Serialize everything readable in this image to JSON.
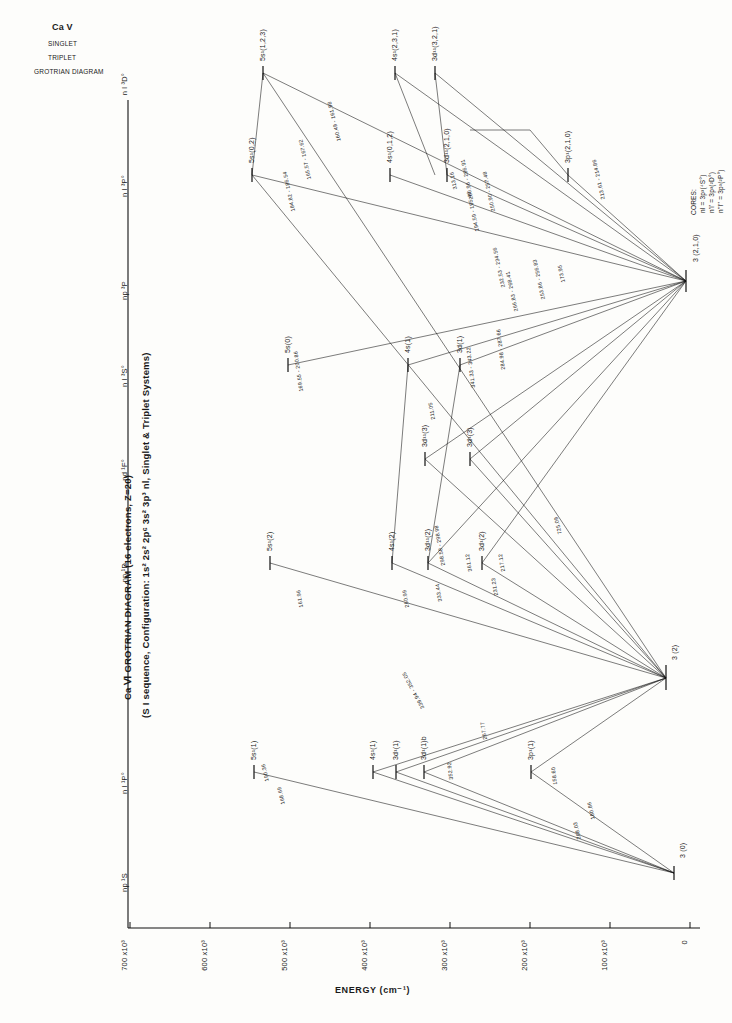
{
  "figure": {
    "corner_title": [
      "Ca V",
      "SINGLET",
      "TRIPLET",
      "GROTRIAN DIAGRAM"
    ],
    "main_title_line1": "Ca Ⅵ GROTRIAN DIAGRAM  (16 electrons, Z=20)",
    "main_title_line2": "(S I sequence, Configuration: 1s² 2s² 2p⁶ 3s² 3p³ nl, Singlet & Triplet  Systems)",
    "y_axis_label": "ENERGY  (cm⁻¹)",
    "cores_title": "CORES:",
    "cores": [
      "nl = 3p³(⁴S°)",
      "n'l' = 3p³(²D°)",
      "n''l'' = 3p³(²P°)"
    ]
  },
  "y_ticks": [
    {
      "label": "0",
      "value": 0
    },
    {
      "label": "100 x10³",
      "value": 100
    },
    {
      "label": "200 x10³",
      "value": 200
    },
    {
      "label": "300 x10³",
      "value": 300
    },
    {
      "label": "400 x10³",
      "value": 400
    },
    {
      "label": "500 x10³",
      "value": 500
    },
    {
      "label": "600 x10³",
      "value": 600
    },
    {
      "label": "700 x10³",
      "value": 700
    }
  ],
  "column_headers": [
    {
      "label": "np ¹S",
      "index": 0
    },
    {
      "label": "n l ¹P°",
      "index": 1
    },
    {
      "label": "np ¹D",
      "index": 2
    },
    {
      "label": "nd ¹F°",
      "index": 3
    },
    {
      "label": "n l ³S°",
      "index": 4
    },
    {
      "label": "np ³P",
      "index": 5
    },
    {
      "label": "n l ³P°",
      "index": 6
    },
    {
      "label": "n l ³D°",
      "index": 7
    }
  ],
  "levels": [
    {
      "label": "3 (0)",
      "col": 0,
      "energy": 4,
      "name": "level-3-0"
    },
    {
      "label": "5s¹(1)",
      "col": 1,
      "energy": 506,
      "name": "level-5s1-1"
    },
    {
      "label": "4s¹(1)",
      "col": 1,
      "energy": 358,
      "name": "level-4s1-1"
    },
    {
      "label": "3d¹(1)",
      "col": 1,
      "energy": 330,
      "name": "level-3d1-1"
    },
    {
      "label": "3d¹(1)b",
      "col": 1,
      "energy": 300,
      "name": "level-3d1-1b"
    },
    {
      "label": "3p¹(1)",
      "col": 1,
      "energy": 216,
      "name": "level-3p1-1"
    },
    {
      "label": "3 (2)",
      "col": 1,
      "energy": 26,
      "name": "level-3-2"
    },
    {
      "label": "5s¹(2)",
      "col": 2,
      "energy": 508,
      "name": "level-5s1-2"
    },
    {
      "label": "4s¹(2)",
      "col": 2,
      "energy": 360,
      "name": "level-4s1-2"
    },
    {
      "label": "3d¹¹(2)",
      "col": 2,
      "energy": 322,
      "name": "level-3d11-2"
    },
    {
      "label": "3d¹(2)",
      "col": 2,
      "energy": 290,
      "name": "level-3d1-2"
    },
    {
      "label": "3d¹¹(3)",
      "col": 3,
      "energy": 325,
      "name": "level-3d11-3"
    },
    {
      "label": "3d¹(3)",
      "col": 3,
      "energy": 300,
      "name": "level-3d1-3"
    },
    {
      "label": "5s(0)",
      "col": 4,
      "energy": 508,
      "name": "level-5s-0"
    },
    {
      "label": "4s(1)",
      "col": 4,
      "energy": 360,
      "name": "level-4s-1"
    },
    {
      "label": "3d(1)",
      "col": 4,
      "energy": 300,
      "name": "level-3d-1"
    },
    {
      "label": "3 (2,1,0)",
      "col": 5,
      "energy": 16,
      "name": "level-3-210"
    },
    {
      "label": "5s¹(0,2)",
      "col": 6,
      "energy": 513,
      "name": "level-5s1-02"
    },
    {
      "label": "4s¹(0,1,2)",
      "col": 6,
      "energy": 365,
      "name": "level-4s1-012"
    },
    {
      "label": "3d¹¹(2,1,0)",
      "col": 6,
      "energy": 318,
      "name": "level-3d11-210"
    },
    {
      "label": "3p¹(2,1,0)",
      "col": 6,
      "energy": 240,
      "name": "level-3p1-210"
    },
    {
      "label": "5s¹(1,2,3)",
      "col": 7,
      "energy": 520,
      "name": "level-5s1-123"
    },
    {
      "label": "4s¹(2,3,1)",
      "col": 7,
      "energy": 372,
      "name": "level-4s1-231"
    },
    {
      "label": "3d¹¹(3,2,1)",
      "col": 7,
      "energy": 330,
      "name": "level-3d11-321"
    }
  ],
  "transition_labels": [
    {
      "text": "168.69",
      "name": "trans-168-69"
    },
    {
      "text": "190.36",
      "name": "trans-190-36"
    },
    {
      "text": "180.86",
      "name": "trans-180-86"
    },
    {
      "text": "208.03",
      "name": "trans-208-03"
    },
    {
      "text": "158.60",
      "name": "trans-158-60"
    },
    {
      "text": "352.92",
      "name": "trans-352-92"
    },
    {
      "text": "267.77",
      "name": "trans-267-77"
    },
    {
      "text": "339.94 - 352.05",
      "name": "trans-339-94-352-05"
    },
    {
      "text": "161.96",
      "name": "trans-161-96"
    },
    {
      "text": "260.99",
      "name": "trans-260-99"
    },
    {
      "text": "333.44",
      "name": "trans-333-44"
    },
    {
      "text": "231.23",
      "name": "trans-231-23"
    },
    {
      "text": "217.12",
      "name": "trans-217-12"
    },
    {
      "text": "361.12",
      "name": "trans-361-12"
    },
    {
      "text": "298.58 - 298.98",
      "name": "trans-298-58-298-98"
    },
    {
      "text": "725.09",
      "name": "trans-725-09"
    },
    {
      "text": "341.33 - 343.22",
      "name": "trans-341-33-343-22"
    },
    {
      "text": "284.98 - 287.66",
      "name": "trans-284-98-287-66"
    },
    {
      "text": "211.05",
      "name": "trans-211-05"
    },
    {
      "text": "169.55 - 200.86",
      "name": "trans-169-55-200-86"
    },
    {
      "text": "253.86 - 256.83",
      "name": "trans-253-86-256-83"
    },
    {
      "text": "266.83 - 268.41",
      "name": "trans-266-83-268-41"
    },
    {
      "text": "173.95",
      "name": "trans-173-95"
    },
    {
      "text": "232.53 - 234.56",
      "name": "trans-232-53-234-56"
    },
    {
      "text": "184.82 - 186.54",
      "name": "trans-184-82-186-54"
    },
    {
      "text": "165.57 - 167.62",
      "name": "trans-165-57-167-62"
    },
    {
      "text": "160.49 - 161.98",
      "name": "trans-160-49-161-98"
    },
    {
      "text": "194.59 - 195.46",
      "name": "trans-194-59-195-46"
    },
    {
      "text": "213.61 - 214.86",
      "name": "trans-213-61-214-86"
    },
    {
      "text": "250.90 - 257.48",
      "name": "trans-250-90-257-48"
    },
    {
      "text": "280.96 - 286.91",
      "name": "trans-280-96-286-91"
    },
    {
      "text": "313.16",
      "name": "trans-313-16"
    }
  ]
}
